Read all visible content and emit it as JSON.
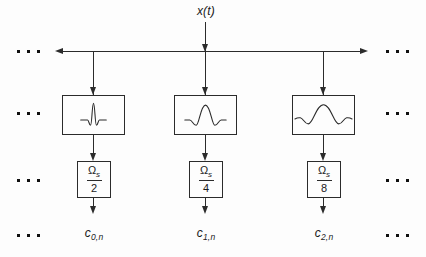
{
  "input": {
    "label": "x(t)"
  },
  "branches": [
    {
      "wavelet_icon": "wavelet-narrow",
      "downsample": {
        "numerator_base": "Ω",
        "numerator_sub": "s",
        "denominator": "2"
      },
      "output": {
        "base": "c",
        "sub": "0,n"
      }
    },
    {
      "wavelet_icon": "wavelet-medium",
      "downsample": {
        "numerator_base": "Ω",
        "numerator_sub": "s",
        "denominator": "4"
      },
      "output": {
        "base": "c",
        "sub": "1,n"
      }
    },
    {
      "wavelet_icon": "wavelet-wide",
      "downsample": {
        "numerator_base": "Ω",
        "numerator_sub": "s",
        "denominator": "8"
      },
      "output": {
        "base": "c",
        "sub": "2,n"
      }
    }
  ],
  "icons": {
    "continuation": "ellipsis"
  },
  "colors": {
    "line": "#2b2b2b",
    "text": "#1a1a1a",
    "background": "#fdfdfd"
  }
}
